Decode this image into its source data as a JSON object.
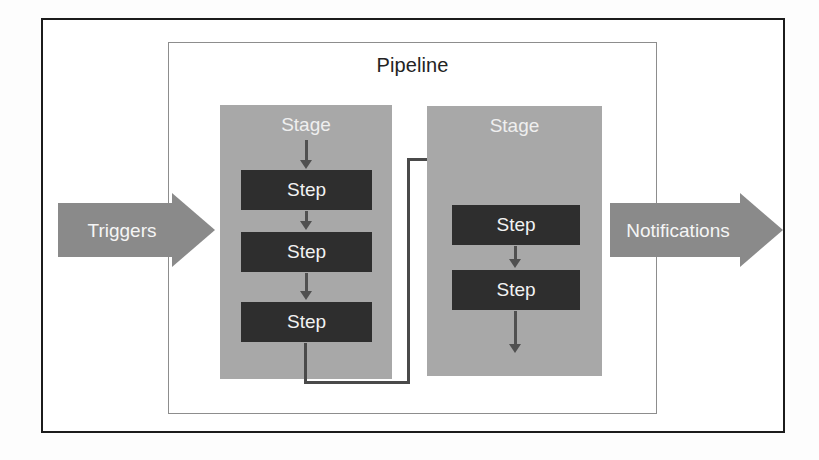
{
  "diagram": {
    "title": "Pipeline",
    "outer_frame": {
      "border_color": "#1c1c1c"
    },
    "inner_box": {
      "label": "Pipeline",
      "border_color": "#8d8d8d"
    },
    "colors": {
      "stage_fill": "#a8a8a8",
      "step_fill": "#2e2e2e",
      "step_text": "#f2f2f2",
      "stage_text": "#efefef",
      "block_arrow_fill": "#8a8a8a",
      "block_arrow_text": "#f5f5f5",
      "connector": "#4a4a4a",
      "background": "#ffffff"
    },
    "input_arrow": {
      "label": "Triggers",
      "direction": "right"
    },
    "output_arrow": {
      "label": "Notifications",
      "direction": "right"
    },
    "stages": [
      {
        "label": "Stage",
        "steps": [
          {
            "label": "Step"
          },
          {
            "label": "Step"
          },
          {
            "label": "Step"
          }
        ]
      },
      {
        "label": "Stage",
        "steps": [
          {
            "label": "Step"
          },
          {
            "label": "Step"
          }
        ]
      }
    ]
  }
}
